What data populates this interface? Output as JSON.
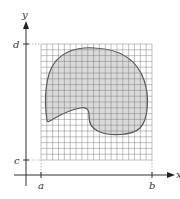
{
  "diagram": {
    "axes": {
      "x_label": "x",
      "y_label": "y"
    },
    "ticks": {
      "a": "a",
      "b": "b",
      "c": "c",
      "d": "d"
    },
    "grid": {
      "columns": 19,
      "rows": 20
    },
    "region": {
      "fill": "#d4d4d4",
      "stroke": "#555555"
    }
  }
}
